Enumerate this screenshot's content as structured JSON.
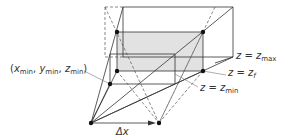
{
  "figure": {
    "colors": {
      "line": "#333333",
      "dashed": "#555555",
      "shaded_plane": "#e2e2e2",
      "dot": "#111111",
      "leader": "#777777"
    }
  },
  "labels": {
    "corner_point": {
      "open": "(",
      "x_var": "x",
      "x_sub": "min",
      "sep1": ", ",
      "y_var": "y",
      "y_sub": "min",
      "sep2": ", ",
      "z_var": "z",
      "z_sub": "min",
      "close": ")"
    },
    "plane_max": {
      "lhs": "z",
      "eq": " = ",
      "rhs": "z",
      "sub": "max"
    },
    "plane_f": {
      "lhs": "z",
      "eq": " = ",
      "rhs": "z",
      "sub": "f"
    },
    "plane_min": {
      "lhs": "z",
      "eq": " = ",
      "rhs": "z",
      "sub": "min"
    },
    "baseline": {
      "symbol": "Δx"
    }
  },
  "points": {
    "eye_left": [
      91,
      123
    ],
    "eye_right": [
      159,
      123
    ],
    "corner_min": [
      110,
      84
    ]
  }
}
